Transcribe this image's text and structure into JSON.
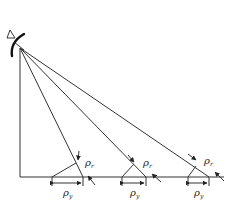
{
  "diagram": {
    "title": "",
    "antenna": {
      "icon": "radar-antenna-icon",
      "apex": [
        20,
        48
      ]
    },
    "baseline_y": 177,
    "cells": [
      {
        "left_x": 52,
        "right_x": 83,
        "rho_r": {
          "main": "ρ",
          "sub": "r"
        },
        "rho_y": {
          "main": "ρ",
          "sub": "y"
        }
      },
      {
        "left_x": 122,
        "right_x": 146,
        "rho_r": {
          "main": "ρ",
          "sub": "r"
        },
        "rho_y": {
          "main": "ρ",
          "sub": "y"
        }
      },
      {
        "left_x": 188,
        "right_x": 209,
        "rho_r": {
          "main": "ρ",
          "sub": "r"
        },
        "rho_y": {
          "main": "ρ",
          "sub": "y"
        }
      }
    ],
    "labels": {
      "rho_r": "ρ",
      "rho_r_sub": "r",
      "rho_y": "ρ",
      "rho_y_sub": "y"
    }
  }
}
